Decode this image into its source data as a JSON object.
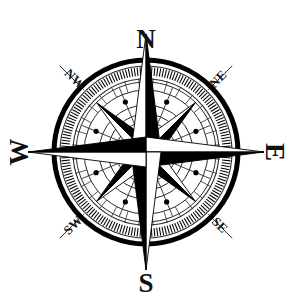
{
  "figure": {
    "kind": "compass-rose",
    "background_color": "#ffffff",
    "ink_color": "#000000",
    "width": 292,
    "height": 303
  },
  "geometry": {
    "center_x": 146,
    "center_y": 152,
    "outer_circle_radius": 92,
    "outer_circle_stroke": 5,
    "tick_ring_outer_radius": 85,
    "tick_ring_inner_radius": 74,
    "tick_count": 180,
    "major_tick_count": 32,
    "ring_radii": [
      70,
      62,
      47,
      38,
      30,
      22
    ],
    "star_long_point_radius": 118,
    "star_short_point_radius": 70,
    "star_point_half_width": 15,
    "dot_radius": 2.6,
    "dot_ring_radii": [
      54,
      54,
      54,
      54,
      54,
      54,
      54,
      54
    ],
    "spoke_count": 16,
    "ordinal_guide_inner_radius": 88,
    "ordinal_guide_outer_radius": 122
  },
  "labels": {
    "cardinal": [
      {
        "name": "north",
        "text": "N",
        "x": 146,
        "y": 42,
        "rotate": 0
      },
      {
        "name": "east",
        "text": "E",
        "x": 272,
        "y": 152,
        "rotate": 90
      },
      {
        "name": "south",
        "text": "S",
        "x": 146,
        "y": 286,
        "rotate": 0
      },
      {
        "name": "west",
        "text": "W",
        "x": 22,
        "y": 152,
        "rotate": -90
      }
    ],
    "ordinal": [
      {
        "name": "northwest",
        "text": "NW",
        "x": 74,
        "y": 80,
        "rotate": 45
      },
      {
        "name": "northeast",
        "text": "NE",
        "x": 219,
        "y": 80,
        "rotate": -45
      },
      {
        "name": "southeast",
        "text": "SE",
        "x": 219,
        "y": 226,
        "rotate": 45
      },
      {
        "name": "southwest",
        "text": "SW",
        "x": 74,
        "y": 226,
        "rotate": -45
      }
    ]
  },
  "colors": {
    "ink": "#000000",
    "hairline": "#2b2b2b",
    "paper": "#ffffff"
  }
}
